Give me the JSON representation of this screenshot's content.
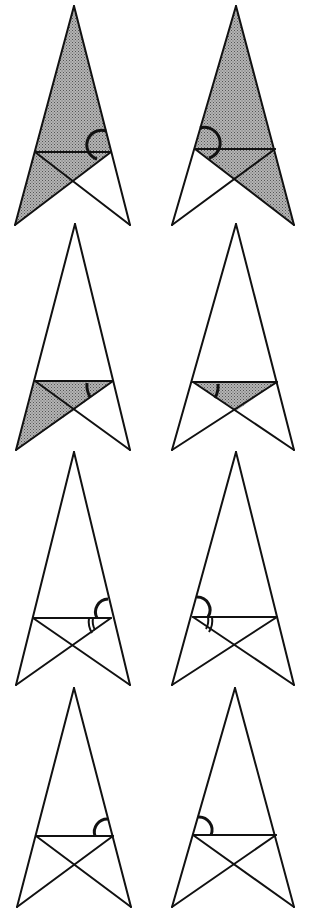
{
  "diagram": {
    "colors": {
      "line": "#111111",
      "shade": "#8a8a8a",
      "background": "#ffffff"
    },
    "rows": [
      {
        "figures": [
          {
            "id": "1L",
            "shaded": "left-large-triangle (apex, left foot, crossbar-right)",
            "angle_mark": "single arc at crossbar-right vertex, above crossbar"
          },
          {
            "id": "1R",
            "shaded": "right-large-triangle (apex, right foot, crossbar-left)",
            "angle_mark": "single arc at crossbar-left vertex, above crossbar"
          }
        ]
      },
      {
        "figures": [
          {
            "id": "2L",
            "shaded": "lower-left region below crossbar (crossbar, left diagonal, left leg)",
            "angle_mark": "single arc at crossbar-right between crossbar and diagonal"
          },
          {
            "id": "2R",
            "shaded": "lower-right region below crossbar",
            "angle_mark": "single arc at crossbar-left between crossbar and diagonal"
          }
        ]
      },
      {
        "figures": [
          {
            "id": "3L",
            "shaded": "none",
            "angle_mark": "single arc above crossbar and double arc below at crossbar-right"
          },
          {
            "id": "3R",
            "shaded": "none",
            "angle_mark": "single arc above crossbar and double arc below at crossbar-left"
          }
        ]
      },
      {
        "figures": [
          {
            "id": "4L",
            "shaded": "none",
            "angle_mark": "single arc above crossbar at crossbar-right"
          },
          {
            "id": "4R",
            "shaded": "none",
            "angle_mark": "single arc above crossbar at crossbar-left"
          }
        ]
      }
    ]
  }
}
